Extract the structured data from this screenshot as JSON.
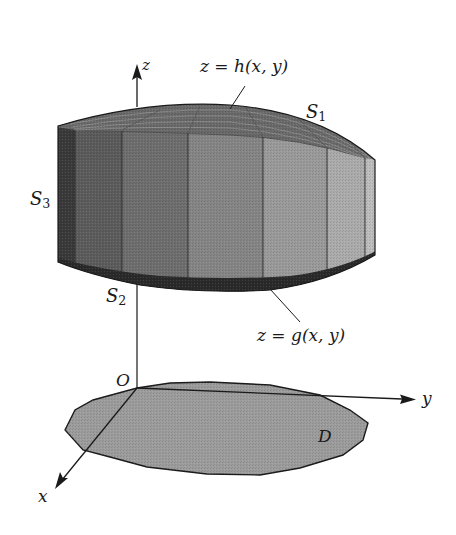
{
  "figure": {
    "colors": {
      "background": "#ffffff",
      "outline": "#1a1a1a",
      "projection_fill": "#9c9c9c",
      "top_surface": "#7a7a7a",
      "bottom_band": "#2a2a2a",
      "panel_shades": [
        "#3a3a3a",
        "#5c5c5c",
        "#6e6e6e",
        "#858585",
        "#9a9a9a",
        "#ababab",
        "#bdbdbd"
      ]
    }
  },
  "axes": {
    "z": {
      "label": "z"
    },
    "y": {
      "label": "y"
    },
    "x": {
      "label": "x"
    },
    "origin": {
      "label": "O"
    }
  },
  "surfaces": {
    "top": {
      "name": "S",
      "sub": "1",
      "equation": "z = h(x, y)"
    },
    "bottom": {
      "name": "S",
      "sub": "2",
      "equation": "z = g(x, y)"
    },
    "lateral": {
      "name": "S",
      "sub": "3"
    }
  },
  "region": {
    "label": "D"
  }
}
